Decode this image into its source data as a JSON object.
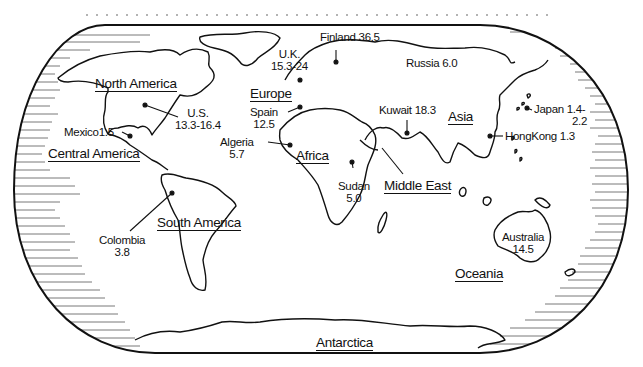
{
  "map": {
    "type": "world outline map",
    "colors": {
      "ink": "#111111",
      "background": "#ffffff",
      "dots": "#9a9a9a"
    },
    "regions": [
      {
        "id": "north-america",
        "label": "North America"
      },
      {
        "id": "central-america",
        "label": "Central America"
      },
      {
        "id": "south-america",
        "label": "South America"
      },
      {
        "id": "europe",
        "label": "Europe"
      },
      {
        "id": "africa",
        "label": "Africa"
      },
      {
        "id": "middle-east",
        "label": "Middle East"
      },
      {
        "id": "asia",
        "label": "Asia"
      },
      {
        "id": "oceania",
        "label": "Oceania"
      },
      {
        "id": "antarctica",
        "label": "Antarctica"
      }
    ],
    "markers": [
      {
        "id": "uk",
        "name": "U.K.",
        "value": "15.3-24"
      },
      {
        "id": "finland",
        "name": "Finland",
        "value": "36.5"
      },
      {
        "id": "russia",
        "name": "Russia",
        "value": "6.0"
      },
      {
        "id": "us",
        "name": "U.S.",
        "value": "13.3-16.4"
      },
      {
        "id": "mexico",
        "name": "Mexico",
        "value": "1.5"
      },
      {
        "id": "spain",
        "name": "Spain",
        "value": "12.5"
      },
      {
        "id": "algeria",
        "name": "Algeria",
        "value": "5.7"
      },
      {
        "id": "kuwait",
        "name": "Kuwait",
        "value": "18.3"
      },
      {
        "id": "sudan",
        "name": "Sudan",
        "value": "5.0"
      },
      {
        "id": "japan",
        "name": "Japan",
        "value": "1.4-",
        "value2": "2.2"
      },
      {
        "id": "hongkong",
        "name": "HongKong",
        "value": "1.3"
      },
      {
        "id": "colombia",
        "name": "Colombia",
        "value": "3.8"
      },
      {
        "id": "australia",
        "name": "Australia",
        "value": "14.5"
      }
    ]
  }
}
